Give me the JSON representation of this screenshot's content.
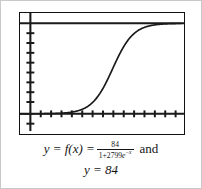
{
  "figure": {
    "caption_line1_prefix": "y = f(x) =",
    "caption_numerator": "84",
    "caption_denominator_pre": "1+2799",
    "caption_denominator_e": "e",
    "caption_denominator_exp": "−x",
    "caption_conjunction": "and",
    "caption_line2": "y = 84"
  },
  "chart_data": {
    "type": "line",
    "title": "",
    "xlabel": "",
    "ylabel": "",
    "grid": false,
    "legend": "none",
    "axis_style": "tick-marks-only-no-labels",
    "xlim": [
      -1.2,
      14.5
    ],
    "ylim": [
      -12,
      100
    ],
    "x_tick_count": 15,
    "y_tick_count": 9,
    "x_tick_step": 1,
    "y_tick_step": 10,
    "series": [
      {
        "name": "y = f(x) = 84/(1+2799e^-x)",
        "kind": "logistic-curve",
        "color": "#1a1a1a",
        "L": 84,
        "A": 2799,
        "k": 1,
        "x0": 7.937,
        "x": [
          0,
          0.5,
          1,
          1.5,
          2,
          2.5,
          3,
          3.5,
          4,
          4.5,
          5,
          5.5,
          6,
          6.5,
          7,
          7.5,
          8,
          8.5,
          9,
          9.5,
          10,
          10.5,
          11,
          11.5,
          12,
          12.5,
          13,
          13.5,
          14
        ],
        "y": [
          0.03,
          0.05,
          0.08,
          0.13,
          0.22,
          0.37,
          0.6,
          0.99,
          1.63,
          2.67,
          4.32,
          6.89,
          10.71,
          16.09,
          23.1,
          31.4,
          40.2,
          48.8,
          56.6,
          63.3,
          68.7,
          72.9,
          76.1,
          78.4,
          80.2,
          81.4,
          82.3,
          82.9,
          83.3
        ]
      },
      {
        "name": "y = 84",
        "kind": "horizontal-asymptote",
        "color": "#1a1a1a",
        "value": 84
      }
    ]
  },
  "elements": {
    "y_axis_name": "y-axis",
    "x_axis_name": "x-axis"
  }
}
